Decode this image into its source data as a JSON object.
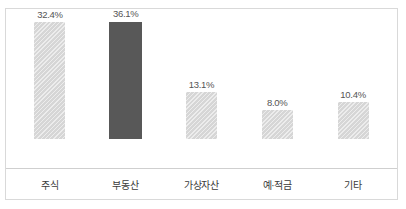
{
  "chart_data": {
    "type": "bar",
    "title": "",
    "subtitle": "",
    "xlabel": "",
    "ylabel": "",
    "categories": [
      "주식",
      "부동산",
      "가상자산",
      "예·적금",
      "기타"
    ],
    "values": [
      32.4,
      36.1,
      13.1,
      8.0,
      10.4
    ],
    "value_labels": [
      "32.4%",
      "36.1%",
      "13.1%",
      "8.0%",
      "10.4%"
    ],
    "ylim": [
      0,
      40
    ],
    "grid": false,
    "legend": null,
    "highlighted_index": 1,
    "colors": {
      "bar": "#d6d6d6",
      "bar_highlight": "#585858",
      "border": "#d9d9d9",
      "axis": "#cfcfcf",
      "value_text": "#555555",
      "category_text": "#3b3b3b"
    }
  }
}
